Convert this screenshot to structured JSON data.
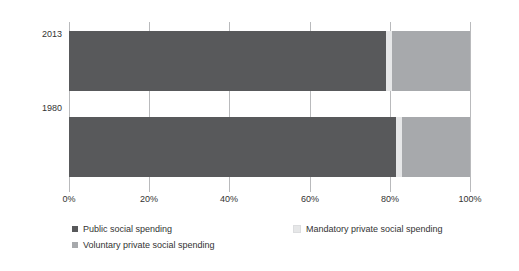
{
  "chart_data": {
    "type": "bar",
    "orientation": "horizontal",
    "stacked": true,
    "normalized": true,
    "title": "",
    "subtitle": "",
    "xlabel": "",
    "ylabel": "",
    "categories": [
      "2013",
      "1980"
    ],
    "xlim": [
      0,
      100
    ],
    "xticks": [
      0,
      20,
      40,
      60,
      80,
      100
    ],
    "xticklabels": [
      "0%",
      "20%",
      "40%",
      "60%",
      "80%",
      "100%"
    ],
    "grid": "vertical",
    "legend_position": "bottom",
    "series": [
      {
        "name": "Public social spending",
        "color": "#58595b",
        "values": [
          79.0,
          81.5
        ]
      },
      {
        "name": "Mandatory private social spending",
        "color": "#e6e7e8",
        "values": [
          1.5,
          1.5
        ]
      },
      {
        "name": "Voluntary private social spending",
        "color": "#a7a9ac",
        "values": [
          19.5,
          17.0
        ]
      }
    ]
  },
  "axis": {
    "y_categories": [
      {
        "label": "2013"
      },
      {
        "label": "1980"
      }
    ],
    "x_ticks": [
      {
        "label": "0%",
        "value": 0
      },
      {
        "label": "20%",
        "value": 20
      },
      {
        "label": "40%",
        "value": 40
      },
      {
        "label": "60%",
        "value": 60
      },
      {
        "label": "80%",
        "value": 80
      },
      {
        "label": "100%",
        "value": 100
      }
    ]
  },
  "legend": {
    "items": [
      {
        "label": "Public social spending",
        "color": "#58595b"
      },
      {
        "label": "Mandatory private social spending",
        "color": "#e6e7e8"
      },
      {
        "label": "Voluntary private social spending",
        "color": "#a7a9ac"
      }
    ]
  },
  "colors": {
    "public": "#58595b",
    "mandatory": "#e6e7e8",
    "voluntary": "#a7a9ac",
    "grid": "#b9babc",
    "text": "#333333",
    "background": "#ffffff"
  }
}
